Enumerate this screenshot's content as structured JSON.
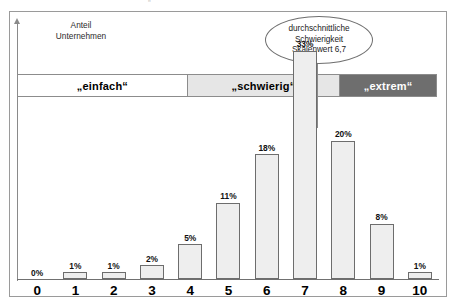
{
  "figure": {
    "y_axis_caption": "Anteil\nUnternehmen",
    "callout_text": "durchschnittliche\nSchwierigkeit\nSkalenwert 6,7",
    "top_remnant": {
      "left": "",
      "center": "„ ”",
      "right": ""
    }
  },
  "bands": [
    {
      "label": "„einfach“",
      "name": "band-einfach",
      "color": "#ffffff",
      "text_color": "#000000",
      "start": 0,
      "end": 4.45
    },
    {
      "label": "„schwierig“",
      "name": "band-schwierig",
      "color": "#e6e6e6",
      "text_color": "#000000",
      "start": 4.45,
      "end": 8.45
    },
    {
      "label": "„extrem“",
      "name": "band-extrem",
      "color": "#6e6e6e",
      "text_color": "#ffffff",
      "start": 8.45,
      "end": 11
    }
  ],
  "chart_data": {
    "type": "bar",
    "title": "",
    "subtitle": "",
    "xlabel": "",
    "ylabel": "Anteil Unternehmen",
    "categories": [
      "0",
      "1",
      "2",
      "3",
      "4",
      "5",
      "6",
      "7",
      "8",
      "9",
      "10"
    ],
    "values": [
      0,
      1,
      1,
      2,
      5,
      11,
      18,
      33,
      20,
      8,
      1
    ],
    "value_labels": [
      "0%",
      "1%",
      "1%",
      "2%",
      "5%",
      "11%",
      "18%",
      "33%",
      "20%",
      "8%",
      "1%"
    ],
    "ylim": [
      0,
      37
    ],
    "grid": false,
    "legend": "none",
    "annotations": [
      {
        "text": "durchschnittliche Schwierigkeit Skalenwert 6,7",
        "value": 6.7,
        "points_to_category": "7"
      }
    ],
    "bands": [
      {
        "label": "„einfach“",
        "range": [
          "0",
          "4"
        ]
      },
      {
        "label": "„schwierig“",
        "range": [
          "5",
          "8"
        ]
      },
      {
        "label": "„extrem“",
        "range": [
          "9",
          "10"
        ]
      }
    ]
  }
}
